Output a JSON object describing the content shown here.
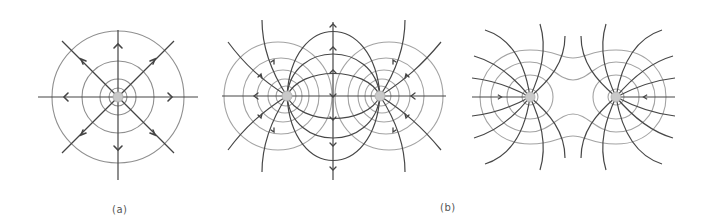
{
  "figure": {
    "panels": [
      {
        "id": "a",
        "label": "(a)",
        "description": "Single point charge: radial field lines with outward arrows and concentric equipotential circles",
        "charge": {
          "x": 118,
          "y": 97
        },
        "equipotential_radii": [
          8,
          18,
          35,
          66
        ],
        "field_line_angles_deg": [
          0,
          45,
          90,
          135,
          180,
          225,
          270,
          315
        ],
        "arrow_direction": "outward"
      },
      {
        "id": "b",
        "label": "(b)",
        "description": "Electric dipole: field lines from positive to negative charge with equipotential circles around each charge",
        "charges": [
          {
            "x": 287,
            "y": 96,
            "sign": "+"
          },
          {
            "x": 380,
            "y": 96,
            "sign": "-"
          }
        ]
      },
      {
        "id": "c",
        "label": "",
        "description": "Two like (negative) charges: field lines pointing inward toward each charge, equipotentials forming peanut-shaped contours",
        "charges": [
          {
            "x": 530,
            "y": 97,
            "sign": "-"
          },
          {
            "x": 616,
            "y": 97,
            "sign": "-"
          }
        ],
        "arrow_direction": "inward"
      }
    ],
    "colors": {
      "field_line": "#4a4a4a",
      "equipotential": "#9a9a9a",
      "charge_fill": "#c8c8c8",
      "label": "#555555"
    }
  },
  "labels": {
    "a": "(a)",
    "b": "(b)"
  }
}
